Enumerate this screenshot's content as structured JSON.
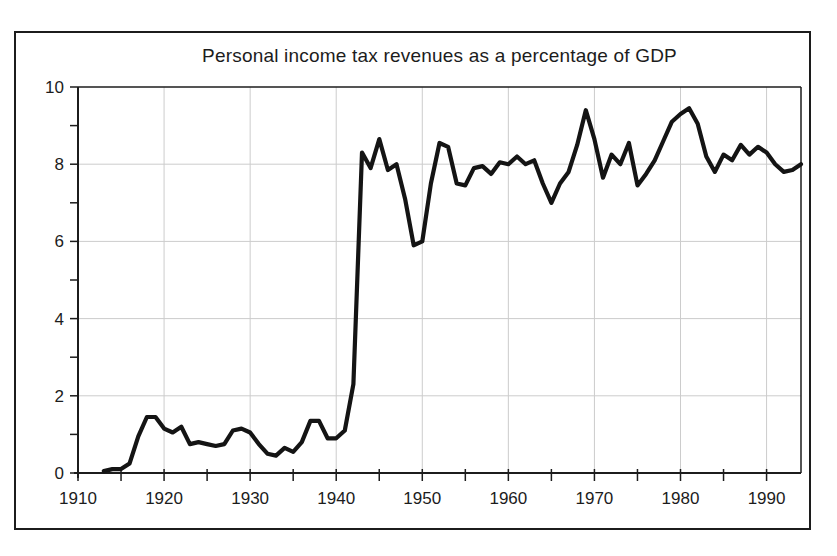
{
  "chart_data": {
    "type": "line",
    "title": "Personal income tax revenues as a percentage of GDP",
    "series_name": "Personal income tax revenues (% of GDP)",
    "x": [
      1913,
      1914,
      1915,
      1916,
      1917,
      1918,
      1919,
      1920,
      1921,
      1922,
      1923,
      1924,
      1925,
      1926,
      1927,
      1928,
      1929,
      1930,
      1931,
      1932,
      1933,
      1934,
      1935,
      1936,
      1937,
      1938,
      1939,
      1940,
      1941,
      1942,
      1943,
      1944,
      1945,
      1946,
      1947,
      1948,
      1949,
      1950,
      1951,
      1952,
      1953,
      1954,
      1955,
      1956,
      1957,
      1958,
      1959,
      1960,
      1961,
      1962,
      1963,
      1964,
      1965,
      1966,
      1967,
      1968,
      1969,
      1970,
      1971,
      1972,
      1973,
      1974,
      1975,
      1976,
      1977,
      1978,
      1979,
      1980,
      1981,
      1982,
      1983,
      1984,
      1985,
      1986,
      1987,
      1988,
      1989,
      1990,
      1991,
      1992,
      1993,
      1994
    ],
    "y": [
      0.05,
      0.1,
      0.1,
      0.25,
      0.95,
      1.45,
      1.45,
      1.15,
      1.05,
      1.2,
      0.75,
      0.8,
      0.75,
      0.7,
      0.75,
      1.1,
      1.15,
      1.05,
      0.75,
      0.5,
      0.45,
      0.65,
      0.55,
      0.8,
      1.35,
      1.35,
      0.9,
      0.9,
      1.1,
      2.3,
      8.3,
      7.9,
      8.65,
      7.85,
      8.0,
      7.1,
      5.9,
      6.0,
      7.5,
      8.55,
      8.45,
      7.5,
      7.45,
      7.9,
      7.95,
      7.75,
      8.05,
      8.0,
      8.2,
      8.0,
      8.1,
      7.5,
      7.0,
      7.5,
      7.8,
      8.5,
      9.4,
      8.65,
      7.65,
      8.25,
      8.0,
      8.55,
      7.45,
      7.75,
      8.1,
      8.6,
      9.1,
      9.3,
      9.45,
      9.05,
      8.2,
      7.8,
      8.25,
      8.1,
      8.5,
      8.25,
      8.45,
      8.3,
      8.0,
      7.8,
      7.85,
      8.0
    ],
    "xlim": [
      1910,
      1994
    ],
    "ylim": [
      0,
      10
    ],
    "x_tick_labels": [
      "1910",
      "1920",
      "1930",
      "1940",
      "1950",
      "1960",
      "1970",
      "1980",
      "1990"
    ],
    "x_tick_label_years": [
      1910,
      1920,
      1930,
      1940,
      1950,
      1960,
      1970,
      1980,
      1990
    ],
    "x_minor_tick_step": 5,
    "y_tick_labels": [
      "0",
      "2",
      "4",
      "6",
      "8",
      "10"
    ],
    "y_tick_label_values": [
      0,
      2,
      4,
      6,
      8,
      10
    ],
    "y_minor_tick_step": 1,
    "grid": true,
    "legend": false,
    "colors": {
      "line": "#141414",
      "grid": "#cccccc",
      "axis": "#1c1c1c",
      "text": "#1c1c1c",
      "figure_border": "#1c1c1c",
      "background": "#ffffff"
    }
  }
}
